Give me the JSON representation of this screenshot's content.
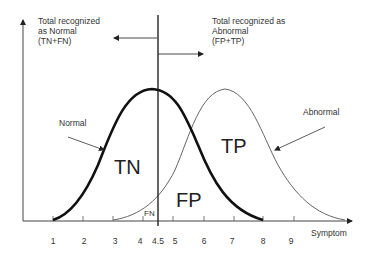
{
  "annotations": {
    "left": {
      "line1": "Total recognized",
      "line2": "as Normal",
      "line3": "(TN+FN)"
    },
    "right": {
      "line1": "Total recognized as",
      "line2": "Abnormal",
      "line3": "(FP+TP)"
    }
  },
  "curves": {
    "normal_label": "Normal",
    "abnormal_label": "Abnormal"
  },
  "regions": {
    "tn": "TN",
    "tp": "TP",
    "fp": "FP",
    "fn": "FN"
  },
  "axis": {
    "xlabel": "Symptom",
    "ticks": [
      "1",
      "2",
      "3",
      "4",
      "4.5",
      "5",
      "6",
      "7",
      "8",
      "9"
    ]
  },
  "threshold": "4.5",
  "colors": {
    "normal_curve": "#111111",
    "abnormal_curve": "#666666",
    "axis": "#333333",
    "text": "#333333"
  }
}
